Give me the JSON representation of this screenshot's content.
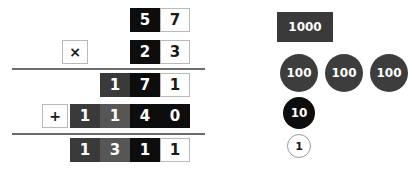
{
  "problem": {
    "multiplicand": "57",
    "multiplier": "23",
    "partial_product_1": "171",
    "partial_product_2": "1140",
    "total": "1311",
    "multiply_operator": "×",
    "add_operator": "+"
  },
  "rows": {
    "multiplicand": [
      {
        "digit": "5",
        "style": "c-black"
      },
      {
        "digit": "7",
        "style": "c-white"
      }
    ],
    "multiplier": [
      {
        "digit": "2",
        "style": "c-black"
      },
      {
        "digit": "3",
        "style": "c-white"
      }
    ],
    "partial1": [
      {
        "digit": "1",
        "style": "c-dark"
      },
      {
        "digit": "7",
        "style": "c-black"
      },
      {
        "digit": "1",
        "style": "c-white"
      }
    ],
    "partial2": [
      {
        "digit": "1",
        "style": "c-dark"
      },
      {
        "digit": "1",
        "style": "c-mid"
      },
      {
        "digit": "4",
        "style": "c-black"
      },
      {
        "digit": "0",
        "style": "c-black"
      }
    ],
    "total": [
      {
        "digit": "1",
        "style": "c-dark"
      },
      {
        "digit": "3",
        "style": "c-mid"
      },
      {
        "digit": "1",
        "style": "c-black"
      },
      {
        "digit": "1",
        "style": "c-white"
      }
    ]
  },
  "place_value_chips": [
    {
      "label": "1000",
      "style": "chip-thousand",
      "x": 277,
      "y": 12
    },
    {
      "label": "100",
      "style": "chip-hundred",
      "x": 280,
      "y": 54
    },
    {
      "label": "100",
      "style": "chip-hundred",
      "x": 325,
      "y": 54
    },
    {
      "label": "100",
      "style": "chip-hundred",
      "x": 370,
      "y": 54
    },
    {
      "label": "10",
      "style": "chip-ten",
      "x": 283,
      "y": 97
    },
    {
      "label": "1",
      "style": "chip-one",
      "x": 287,
      "y": 134
    }
  ],
  "colors": {
    "background": "#ffffff",
    "black_cell": "#0d0d0d",
    "dark_cell": "#3a3a3a",
    "mid_cell": "#565656",
    "white_cell": "#ffffff",
    "rule": "#6b6b6b",
    "cell_border": "#b9b9b9"
  }
}
